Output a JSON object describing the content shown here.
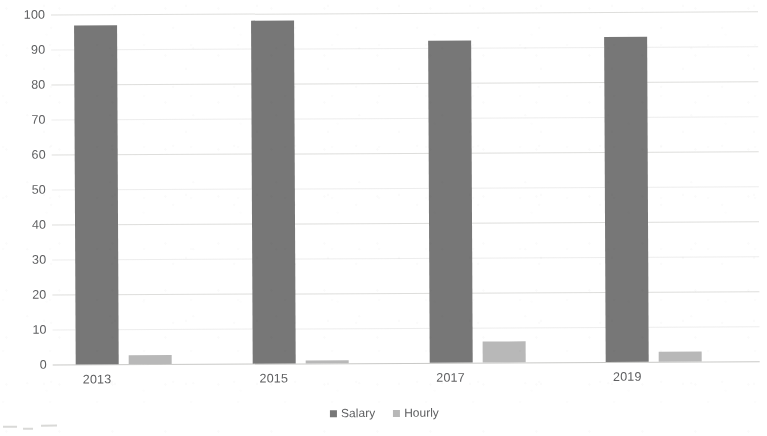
{
  "chart_data": {
    "type": "bar",
    "title": "",
    "subtitle": "",
    "xlabel": "",
    "ylabel": "",
    "categories": [
      "2013",
      "2015",
      "2017",
      "2019"
    ],
    "series": [
      {
        "name": "Salary",
        "values": [
          97,
          98,
          92,
          93
        ],
        "color": "#767676"
      },
      {
        "name": "Hourly",
        "values": [
          2.5,
          1,
          6,
          3
        ],
        "color": "#b8b8b8"
      }
    ],
    "ylim": [
      0,
      100
    ],
    "ytick_values": [
      100,
      90,
      80,
      70,
      60,
      50,
      40,
      30,
      20,
      10,
      0
    ],
    "ytick_labels": [
      "100",
      "90",
      "80",
      "70",
      "60",
      "50",
      "40",
      "30",
      "20",
      "10",
      "0"
    ],
    "grid": true,
    "grid_axis": "y",
    "legend": true,
    "legend_position": "bottom",
    "legend_entries": [
      "Salary",
      "Hourly"
    ],
    "bar_mode": "grouped",
    "background_color": "#ffffff",
    "axis_text_color": "#5c5d5f",
    "gridline_color": "#d8d8d6"
  }
}
